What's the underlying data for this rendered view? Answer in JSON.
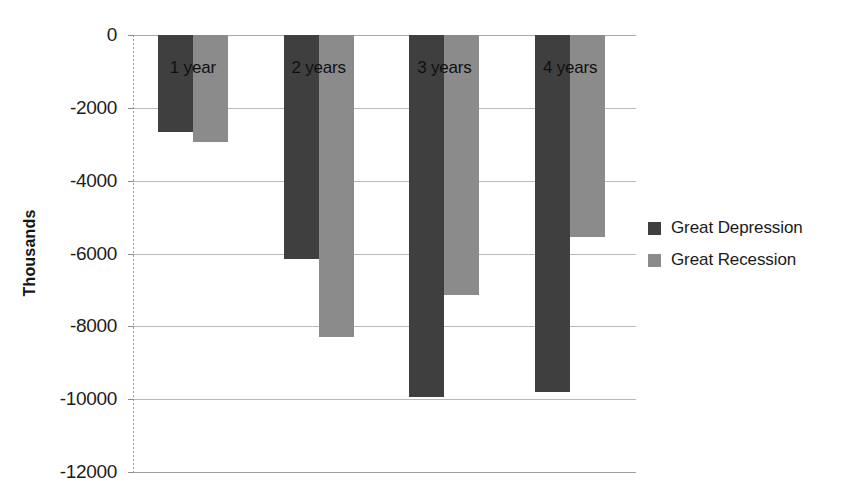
{
  "chart_data": {
    "type": "bar",
    "title": "",
    "subtitle": "",
    "xlabel": "",
    "ylabel": "Thousands",
    "categories": [
      "1 year",
      "2 years",
      "3 years",
      "4 years"
    ],
    "series": [
      {
        "name": "Great Depression",
        "color": "#3f3f3f",
        "values": [
          -2650,
          -6150,
          -9950,
          -9800
        ]
      },
      {
        "name": "Great Recession",
        "color": "#8b8b8b",
        "values": [
          -2950,
          -8300,
          -7150,
          -5550
        ]
      }
    ],
    "ylim": [
      -12000,
      0
    ],
    "y_ticks": [
      0,
      -2000,
      -4000,
      -6000,
      -8000,
      -10000,
      -12000
    ],
    "y_tick_labels": [
      "0",
      "-2000",
      "-4000",
      "-6000",
      "-8000",
      "-10000",
      "-12000"
    ],
    "grid": true,
    "legend_position": "right",
    "category_labels_inside_bars": true,
    "annotations": []
  },
  "legend": {
    "items": [
      {
        "label": "Great Depression",
        "color": "#3f3f3f"
      },
      {
        "label": "Great Recession",
        "color": "#8b8b8b"
      }
    ]
  },
  "axis": {
    "y_title": "Thousands"
  }
}
